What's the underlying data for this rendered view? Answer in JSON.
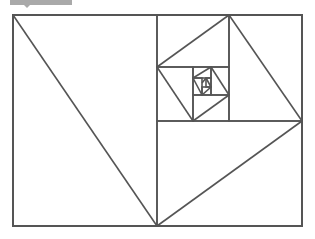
{
  "diagram": {
    "stroke_color": "#555555",
    "tab_color": "#a9a9a9",
    "outer_rect": {
      "x1": 13,
      "y1": 15,
      "x2": 302,
      "y2": 226
    },
    "rects": [
      [
        13,
        15,
        302,
        226
      ],
      [
        157,
        15,
        302,
        226
      ],
      [
        157,
        121,
        302,
        226
      ],
      [
        229,
        15,
        302,
        121
      ],
      [
        157,
        15,
        229,
        67
      ],
      [
        157,
        67,
        193,
        121
      ],
      [
        193,
        95,
        229,
        121
      ],
      [
        211,
        67,
        229,
        95
      ],
      [
        193,
        67,
        211,
        78
      ],
      [
        193,
        78,
        202,
        95
      ],
      [
        202,
        87,
        211,
        95
      ],
      [
        206,
        78,
        211,
        87
      ]
    ],
    "diagonals": [
      [
        13,
        15,
        157,
        226
      ],
      [
        157,
        226,
        302,
        121
      ],
      [
        302,
        121,
        229,
        15
      ],
      [
        229,
        15,
        157,
        67
      ],
      [
        157,
        67,
        193,
        121
      ],
      [
        193,
        121,
        229,
        95
      ],
      [
        229,
        95,
        211,
        67
      ],
      [
        211,
        67,
        193,
        78
      ],
      [
        193,
        78,
        202,
        95
      ],
      [
        202,
        95,
        211,
        87
      ],
      [
        211,
        87,
        206,
        78
      ],
      [
        206,
        78,
        202,
        83
      ]
    ]
  }
}
